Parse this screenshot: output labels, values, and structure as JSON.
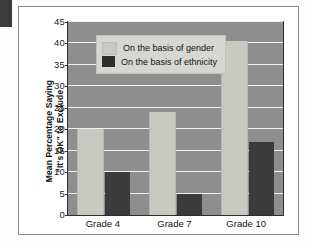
{
  "chart_data": {
    "type": "bar",
    "title": "",
    "xlabel": "",
    "ylabel": "Mean Percentage Saying \"It's OK\" to Exclude",
    "ylabel_line1": "Mean Percentage Saying",
    "ylabel_line2": "\"It's OK\" to Exclude",
    "categories": [
      "Grade 4",
      "Grade 7",
      "Grade 10"
    ],
    "series": [
      {
        "name": "On the basis of gender",
        "values": [
          20,
          24,
          40.5
        ],
        "color": "#c9c9c4"
      },
      {
        "name": "On the basis of ethnicity",
        "values": [
          10,
          5,
          17
        ],
        "color": "#3b3b3b"
      }
    ],
    "ylim": [
      0,
      45
    ],
    "ytick_step": 5,
    "yticks": [
      0,
      5,
      10,
      15,
      20,
      25,
      30,
      35,
      40,
      45
    ],
    "grid": true,
    "legend_position": "top-left",
    "plot_background": "#8e8e8e",
    "gridline_color": "#f2f2f2"
  },
  "legend": {
    "items": [
      {
        "label": "On the basis of gender",
        "swatch": "gender"
      },
      {
        "label": "On the basis of ethnicity",
        "swatch": "ethnicity"
      }
    ]
  }
}
